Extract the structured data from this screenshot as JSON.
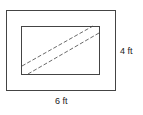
{
  "diagram": {
    "outer_rect": {
      "x": 6.5,
      "y": 10.5,
      "width": 109,
      "height": 80
    },
    "inner_rect": {
      "x": 21.5,
      "y": 26.5,
      "width": 78,
      "height": 48
    },
    "dashed_lines": [
      {
        "x1": 22,
        "y1": 66,
        "x2": 93,
        "y2": 26
      },
      {
        "x1": 28,
        "y1": 74,
        "x2": 99,
        "y2": 33
      }
    ],
    "labels": {
      "height": "4 ft",
      "width": "6 ft"
    }
  }
}
